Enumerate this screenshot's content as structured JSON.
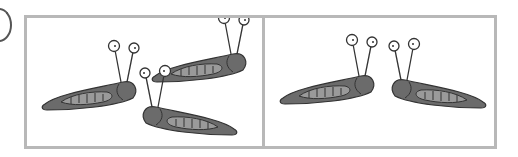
{
  "figure": {
    "panels": [
      {
        "id": "left",
        "slug_count": 3,
        "description": "three slugs"
      },
      {
        "id": "right",
        "slug_count": 2,
        "description": "two slugs facing each other"
      }
    ],
    "colors": {
      "border": "#b8b8b8",
      "slug_body": "#6b6b6b",
      "slug_shell": "#9a9a9a",
      "outline": "#333333"
    }
  }
}
